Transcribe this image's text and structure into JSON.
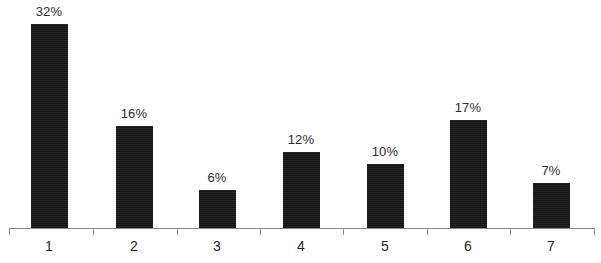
{
  "chart_data": {
    "type": "bar",
    "title": "",
    "xlabel": "",
    "ylabel": "",
    "categories": [
      "1",
      "2",
      "3",
      "4",
      "5",
      "6",
      "7"
    ],
    "values": [
      32,
      16,
      6,
      12,
      10,
      17,
      7
    ],
    "value_labels": [
      "32%",
      "16%",
      "6%",
      "12%",
      "10%",
      "17%",
      "7%"
    ],
    "unit": "%",
    "ylim": [
      0,
      32
    ],
    "grid": false,
    "legend": "none",
    "bar_color": "#1d1d1d",
    "axis_color": "#8a8a8a",
    "background_color": "#ffffff"
  },
  "axis": {
    "baseline_label": "",
    "tick_count": 8
  }
}
